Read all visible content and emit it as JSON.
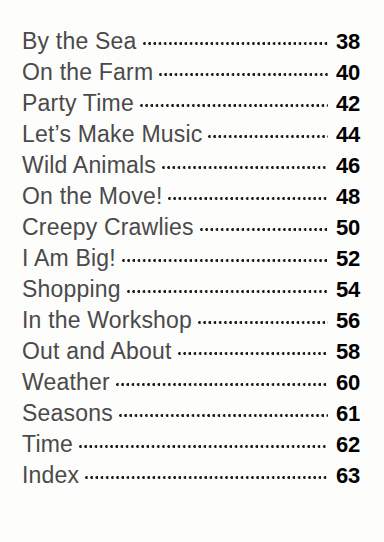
{
  "page": {
    "kind": "table-of-contents",
    "background_color": "#fdfdfc",
    "title_color": "#4a4a4a",
    "page_number_color": "#000000",
    "leader_style": "dotted"
  },
  "entries": [
    {
      "title": "By the Sea",
      "page": "38"
    },
    {
      "title": "On the Farm",
      "page": "40"
    },
    {
      "title": "Party Time",
      "page": "42"
    },
    {
      "title": "Let’s Make Music",
      "page": "44"
    },
    {
      "title": "Wild Animals",
      "page": "46"
    },
    {
      "title": "On the Move!",
      "page": "48"
    },
    {
      "title": "Creepy Crawlies",
      "page": "50"
    },
    {
      "title": "I Am Big!",
      "page": "52"
    },
    {
      "title": "Shopping",
      "page": "54"
    },
    {
      "title": "In the Workshop",
      "page": "56"
    },
    {
      "title": "Out and About",
      "page": "58"
    },
    {
      "title": "Weather",
      "page": "60"
    },
    {
      "title": "Seasons",
      "page": "61"
    },
    {
      "title": "Time",
      "page": "62"
    },
    {
      "title": "Index",
      "page": "63"
    }
  ]
}
